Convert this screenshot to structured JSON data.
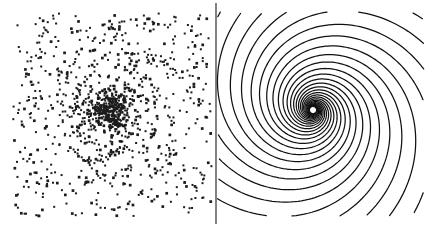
{
  "figure": {
    "title": "",
    "background_color": "#ffffff",
    "width": 425,
    "height": 227,
    "ink_color": "#111111",
    "divider": {
      "name": "panel-divider",
      "x": 216,
      "y_top": 3,
      "y_bottom": 224,
      "color": "#1a1a1a",
      "width": 1.1
    }
  },
  "chart_data": {
    "type": "scatter",
    "title": "",
    "subtitle": "",
    "xlabel": "",
    "ylabel": "",
    "grid": false,
    "legend": "none",
    "panels": [
      {
        "id": "left-panel",
        "name": "particle-spiral-panel",
        "type": "scatter",
        "label": "",
        "description": "dot pattern tracing spiral arms",
        "marker": "square",
        "marker_size_px": 2,
        "marker_color": "#1c1c1c",
        "point_count": 1150,
        "bounds": {
          "x0": 13,
          "y0": 12,
          "x1": 212,
          "y1": 216
        },
        "center": {
          "x": 110,
          "y": 112
        },
        "spiral": {
          "arms": 5,
          "pitch": 0.34,
          "winding": "counterclockwise",
          "turns": 2.35,
          "r_min": 3,
          "r_max": 150,
          "scatter_sigma": 7.5,
          "phase_offset_deg": 0
        },
        "background_density": 0.3
      },
      {
        "id": "right-panel",
        "name": "streamline-spiral-panel",
        "type": "line",
        "label": "",
        "description": "continuous logarithmic spiral streamlines",
        "line_color": "#111111",
        "line_width": 1.25,
        "curve_count": 13,
        "bounds": {
          "x0": 217,
          "y0": 12,
          "x1": 424,
          "y1": 216
        },
        "center": {
          "x": 313,
          "y": 110
        },
        "spiral": {
          "arms": 13,
          "pitch": 0.3,
          "winding": "counterclockwise",
          "turns": 2.7,
          "r_min": 3.5,
          "r_max": 230,
          "phase_offset_deg": 0
        }
      }
    ],
    "series": [
      {
        "name": "particles",
        "panel": "left-panel",
        "values": []
      },
      {
        "name": "streamlines",
        "panel": "right-panel",
        "values": []
      }
    ]
  }
}
